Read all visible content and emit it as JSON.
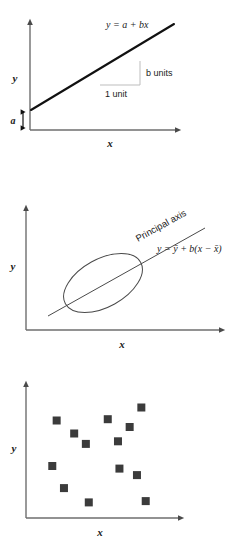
{
  "figure": {
    "background_color": "#ffffff",
    "line_color": "#111111",
    "axis_color": "#6e6e6e",
    "marker_color": "#3b3b3b"
  },
  "panels": [
    {
      "id": "panel-1",
      "name": "linear-regression-line",
      "x_axis_label": "x",
      "y_axis_label": "y",
      "equation_label": "y = a + bx",
      "intercept_label": "a",
      "run_label": "1 unit",
      "rise_label": "b units"
    },
    {
      "id": "panel-2",
      "name": "principal-axis-ellipse",
      "x_axis_label": "x",
      "y_axis_label": "y",
      "axis_name_label": "Principal axis",
      "equation_label": "y = ȳ + b(x − x̄)"
    },
    {
      "id": "panel-3",
      "name": "scatter-plot",
      "x_axis_label": "x",
      "y_axis_label": "y"
    }
  ],
  "chart_data": [
    {
      "type": "line",
      "name": "straight-line-regression",
      "title": "",
      "xlabel": "x",
      "ylabel": "y",
      "annotations": [
        {
          "text": "y = a + bx",
          "role": "equation"
        },
        {
          "text": "a",
          "role": "intercept"
        },
        {
          "text": "1 unit",
          "role": "run"
        },
        {
          "text": "b units",
          "role": "rise"
        }
      ],
      "series": [
        {
          "name": "y = a + bx",
          "x": [
            0,
            10
          ],
          "y": [
            1.2,
            9.2
          ]
        }
      ],
      "xlim": [
        0,
        10
      ],
      "ylim": [
        0,
        10
      ],
      "grid": false,
      "legend": "none"
    },
    {
      "type": "scatter",
      "name": "principal-axis-with-confidence-ellipse",
      "title": "",
      "xlabel": "x",
      "ylabel": "y",
      "annotations": [
        {
          "text": "Principal axis",
          "role": "line-label"
        },
        {
          "text": "y = ȳ + b(x − x̄)",
          "role": "equation"
        }
      ],
      "ellipse": {
        "center_x": 4.9,
        "center_y": 5.0,
        "semi_major": 3.1,
        "semi_minor": 1.6,
        "rotation_deg": -31
      },
      "series": [
        {
          "name": "principal axis",
          "x": [
            1.1,
            9.4
          ],
          "y": [
            2.3,
            7.5
          ]
        }
      ],
      "xlim": [
        0,
        10
      ],
      "ylim": [
        0,
        10
      ],
      "grid": false,
      "legend": "none"
    },
    {
      "type": "scatter",
      "name": "raw-scatter-of-points",
      "title": "",
      "xlabel": "x",
      "ylabel": "y",
      "marker": "square",
      "points": [
        {
          "x": 2.1,
          "y": 7.5
        },
        {
          "x": 3.3,
          "y": 6.5
        },
        {
          "x": 4.1,
          "y": 5.7
        },
        {
          "x": 5.6,
          "y": 7.6
        },
        {
          "x": 6.3,
          "y": 5.9
        },
        {
          "x": 7.1,
          "y": 7.0
        },
        {
          "x": 7.9,
          "y": 8.5
        },
        {
          "x": 1.8,
          "y": 4.0
        },
        {
          "x": 6.4,
          "y": 3.8
        },
        {
          "x": 7.6,
          "y": 3.3
        },
        {
          "x": 2.6,
          "y": 2.3
        },
        {
          "x": 4.3,
          "y": 1.2
        },
        {
          "x": 8.2,
          "y": 1.3
        }
      ],
      "xlim": [
        0,
        10
      ],
      "ylim": [
        0,
        10
      ],
      "grid": false,
      "legend": "none"
    }
  ]
}
